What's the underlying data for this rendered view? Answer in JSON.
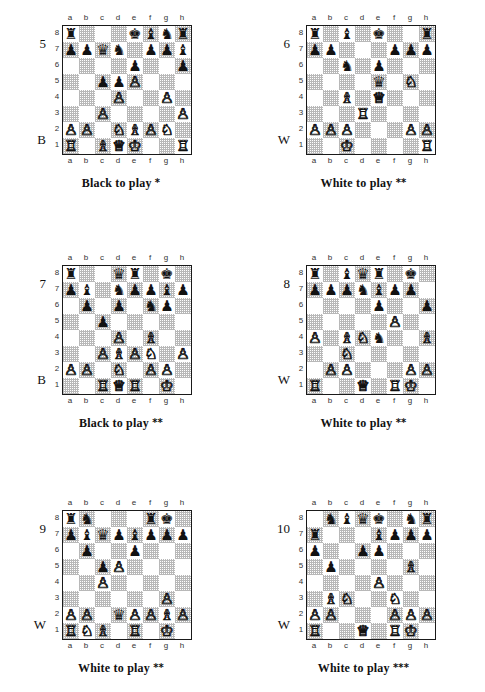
{
  "page": {
    "files": [
      "a",
      "b",
      "c",
      "d",
      "e",
      "f",
      "g",
      "h"
    ],
    "ranks": [
      "8",
      "7",
      "6",
      "5",
      "4",
      "3",
      "2",
      "1"
    ],
    "colors": {
      "light_square": "#ffffff",
      "dark_square": "#b9b9b9",
      "border": "#1a1a1a",
      "text": "#111111"
    }
  },
  "puzzles": [
    {
      "number": "5",
      "side_flag": "B",
      "caption": "Black to play",
      "stars": "*",
      "position": [
        [
          "br",
          "",
          "",
          "",
          "bk",
          "bb",
          "bn",
          "br"
        ],
        [
          "bp",
          "bp",
          "bq",
          "bn",
          "",
          "bp",
          "bp",
          "bb"
        ],
        [
          "",
          "",
          "",
          "",
          "bp",
          "",
          "",
          "bp"
        ],
        [
          "",
          "",
          "bp",
          "bp",
          "wp",
          "",
          "",
          ""
        ],
        [
          "",
          "",
          "",
          "wp",
          "",
          "",
          "wp",
          ""
        ],
        [
          "",
          "",
          "wp",
          "",
          "",
          "",
          "",
          "wp"
        ],
        [
          "wp",
          "wp",
          "",
          "wn",
          "wb",
          "wp",
          "wn",
          ""
        ],
        [
          "wr",
          "",
          "wb",
          "wq",
          "wk",
          "",
          "",
          "wr"
        ]
      ]
    },
    {
      "number": "6",
      "side_flag": "W",
      "caption": "White to play",
      "stars": "**",
      "position": [
        [
          "br",
          "",
          "bb",
          "",
          "bk",
          "",
          "",
          "br"
        ],
        [
          "bp",
          "bp",
          "",
          "",
          "",
          "bp",
          "bp",
          "bp"
        ],
        [
          "",
          "",
          "bn",
          "",
          "bp",
          "",
          "",
          ""
        ],
        [
          "",
          "",
          "",
          "",
          "bq",
          "",
          "wn",
          ""
        ],
        [
          "",
          "",
          "wb",
          "",
          "wq",
          "",
          "",
          ""
        ],
        [
          "",
          "",
          "",
          "wr",
          "",
          "",
          "",
          ""
        ],
        [
          "wp",
          "wp",
          "wp",
          "",
          "",
          "",
          "wp",
          "wp"
        ],
        [
          "",
          "",
          "wk",
          "",
          "",
          "",
          "",
          "wr"
        ]
      ]
    },
    {
      "number": "7",
      "side_flag": "B",
      "caption": "Black to play",
      "stars": "**",
      "position": [
        [
          "br",
          "",
          "",
          "bq",
          "br",
          "",
          "bk",
          ""
        ],
        [
          "bp",
          "bb",
          "",
          "bn",
          "bp",
          "bp",
          "bb",
          "bp"
        ],
        [
          "",
          "bp",
          "",
          "bp",
          "",
          "bn",
          "bp",
          ""
        ],
        [
          "",
          "",
          "bp",
          "",
          "",
          "",
          "",
          ""
        ],
        [
          "",
          "",
          "",
          "wp",
          "",
          "wb",
          "",
          ""
        ],
        [
          "",
          "",
          "wp",
          "wb",
          "wp",
          "wn",
          "",
          "wp"
        ],
        [
          "wp",
          "wp",
          "",
          "wn",
          "",
          "wp",
          "wp",
          ""
        ],
        [
          "",
          "",
          "wr",
          "wq",
          "wr",
          "",
          "wk",
          ""
        ]
      ]
    },
    {
      "number": "8",
      "side_flag": "W",
      "caption": "White to play",
      "stars": "**",
      "position": [
        [
          "br",
          "",
          "bb",
          "bq",
          "br",
          "",
          "bk",
          ""
        ],
        [
          "bp",
          "bp",
          "bp",
          "bn",
          "bb",
          "bp",
          "bp",
          ""
        ],
        [
          "",
          "",
          "",
          "",
          "bp",
          "",
          "",
          "bp"
        ],
        [
          "",
          "",
          "",
          "",
          "",
          "wp",
          "",
          ""
        ],
        [
          "wp",
          "",
          "wb",
          "wn",
          "bn",
          "",
          "",
          "wb"
        ],
        [
          "",
          "",
          "wn",
          "",
          "",
          "",
          "",
          ""
        ],
        [
          "",
          "wp",
          "wp",
          "",
          "",
          "",
          "wp",
          "wp"
        ],
        [
          "wr",
          "",
          "",
          "wq",
          "",
          "wr",
          "wk",
          ""
        ]
      ]
    },
    {
      "number": "9",
      "side_flag": "W",
      "caption": "White to play",
      "stars": "**",
      "position": [
        [
          "br",
          "bn",
          "",
          "",
          "",
          "br",
          "bk",
          ""
        ],
        [
          "bp",
          "bb",
          "bq",
          "bp",
          "bb",
          "bp",
          "bp",
          "bp"
        ],
        [
          "",
          "bp",
          "",
          "",
          "bp",
          "",
          "",
          ""
        ],
        [
          "",
          "",
          "bp",
          "wp",
          "",
          "",
          "",
          ""
        ],
        [
          "",
          "",
          "wp",
          "",
          "",
          "",
          "",
          ""
        ],
        [
          "",
          "",
          "",
          "",
          "",
          "",
          "wp",
          ""
        ],
        [
          "wp",
          "wp",
          "",
          "bq",
          "wp",
          "wp",
          "wb",
          "wp"
        ],
        [
          "wr",
          "wn",
          "wb",
          "",
          "wr",
          "",
          "wk",
          ""
        ]
      ]
    },
    {
      "number": "10",
      "side_flag": "W",
      "caption": "White to play",
      "stars": "***",
      "position": [
        [
          "",
          "bn",
          "bb",
          "bq",
          "bk",
          "",
          "bn",
          "br"
        ],
        [
          "br",
          "",
          "",
          "",
          "bb",
          "bp",
          "bp",
          "bp"
        ],
        [
          "bp",
          "",
          "",
          "bp",
          "bp",
          "",
          "",
          ""
        ],
        [
          "",
          "bp",
          "",
          "",
          "",
          "",
          "wb",
          ""
        ],
        [
          "",
          "",
          "",
          "",
          "wp",
          "",
          "",
          ""
        ],
        [
          "",
          "wb",
          "wn",
          "",
          "",
          "wn",
          "",
          ""
        ],
        [
          "wp",
          "wp",
          "",
          "",
          "",
          "wp",
          "wp",
          "wp"
        ],
        [
          "wr",
          "",
          "",
          "wq",
          "",
          "wr",
          "wk",
          ""
        ]
      ]
    }
  ],
  "glyphs": {
    "wk": "♔",
    "wq": "♕",
    "wr": "♖",
    "wb": "♗",
    "wn": "♘",
    "wp": "♙",
    "bk": "♚",
    "bq": "♛",
    "br": "♜",
    "bb": "♝",
    "bn": "♞",
    "bp": "♟"
  },
  "piece_names": {
    "wk": "white-king",
    "wq": "white-queen",
    "wr": "white-rook",
    "wb": "white-bishop",
    "wn": "white-knight",
    "wp": "white-pawn",
    "bk": "black-king",
    "bq": "black-queen",
    "br": "black-rook",
    "bb": "black-bishop",
    "bn": "black-knight",
    "bp": "black-pawn"
  }
}
